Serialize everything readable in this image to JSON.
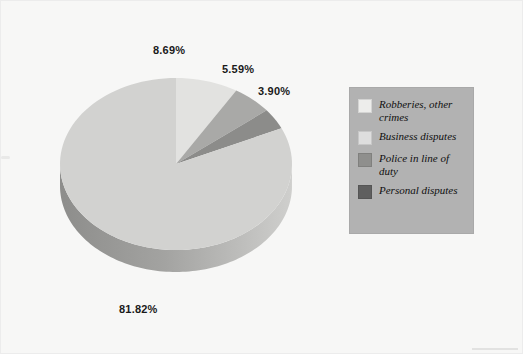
{
  "chart_data": {
    "type": "pie",
    "title": "",
    "subtitle": "",
    "xlabel": "",
    "ylabel": "",
    "grid": false,
    "legend_position": "right",
    "style": "3d-exploded-none",
    "categories": [
      "Robberies, other crimes",
      "Business disputes",
      "Police in line of duty",
      "Personal disputes"
    ],
    "values": [
      8.69,
      5.59,
      3.9,
      81.82
    ],
    "value_labels": [
      "8.69%",
      "5.59%",
      "3.90%",
      "81.82%"
    ],
    "colors": [
      "#e2e2e0",
      "#a9a9a7",
      "#8c8c8a",
      "#d2d2d0"
    ],
    "legend_colors": [
      "#ededeb",
      "#dedede",
      "#8f8f8d",
      "#5f5f5f"
    ],
    "slices": [
      {
        "label": "Robberies, other crimes",
        "value": 8.69,
        "value_label": "8.69%",
        "color": "#e2e2e0"
      },
      {
        "label": "Business disputes",
        "value": 5.59,
        "value_label": "5.59%",
        "color": "#a9a9a7"
      },
      {
        "label": "Police in line of duty",
        "value": 3.9,
        "value_label": "3.90%",
        "color": "#8c8c8a"
      },
      {
        "label": "Personal disputes",
        "value": 81.82,
        "value_label": "81.82%",
        "color": "#d2d2d0"
      }
    ]
  },
  "legend": {
    "items": [
      {
        "label": "Robberies, other crimes",
        "color": "#ededeb"
      },
      {
        "label": "Business disputes",
        "color": "#dedede"
      },
      {
        "label": "Police in line of duty",
        "color": "#8f8f8d"
      },
      {
        "label": "Personal disputes",
        "color": "#5f5f5f"
      }
    ]
  },
  "labels": {
    "pct_0": "8.69%",
    "pct_1": "5.59%",
    "pct_2": "3.90%",
    "pct_3": "81.82%"
  },
  "theme": {
    "background": "#f7f7f6",
    "legend_background": "#b2b2b2",
    "label_color": "#1a1a1a",
    "pie_side_dark": "#8e8e8c",
    "pie_side_light": "#c6c6c4"
  }
}
